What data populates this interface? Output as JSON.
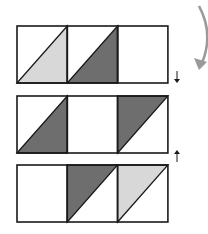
{
  "figure": {
    "colors": {
      "light": "#d8d8d8",
      "dark": "#6e6e6e",
      "stroke": "#1a1a1a",
      "curved_arrow": "#9a9a9a"
    },
    "rows": [
      {
        "cells": [
          {
            "shade": "light",
            "triangle": "bottom-right"
          },
          {
            "shade": "dark",
            "triangle": "bottom-right"
          },
          {
            "shade": "none",
            "triangle": "none"
          }
        ],
        "side_arrow": "down"
      },
      {
        "cells": [
          {
            "shade": "dark",
            "triangle": "bottom-right"
          },
          {
            "shade": "none",
            "triangle": "none"
          },
          {
            "shade": "dark",
            "triangle": "top-left"
          }
        ],
        "side_arrow": "none"
      },
      {
        "cells": [
          {
            "shade": "none",
            "triangle": "none"
          },
          {
            "shade": "dark",
            "triangle": "top-left"
          },
          {
            "shade": "light",
            "triangle": "top-left"
          }
        ],
        "side_arrow": "up"
      }
    ],
    "curved_arrow": "clockwise-down"
  }
}
